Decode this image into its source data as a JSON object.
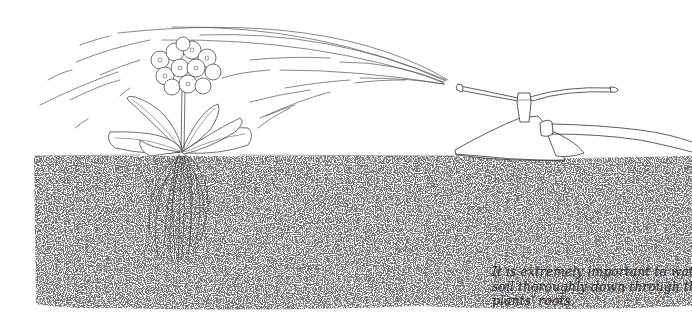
{
  "illustration": {
    "subject": "Plant being watered by a lawn sprinkler, showing roots in soil",
    "elements": {
      "plant": "flowering-plant",
      "sprinkler": "rotating-lawn-sprinkler",
      "hose": "garden-hose",
      "soil": "stippled-soil-cross-section",
      "water": "water-spray-arcs"
    },
    "colors": {
      "line": "#333333",
      "soil_dots": "#555555",
      "background": "#ffffff"
    }
  },
  "caption": {
    "lines": [
      "It is extremely important to water the",
      "soil thoroughly down through the",
      "plants' roots."
    ]
  }
}
